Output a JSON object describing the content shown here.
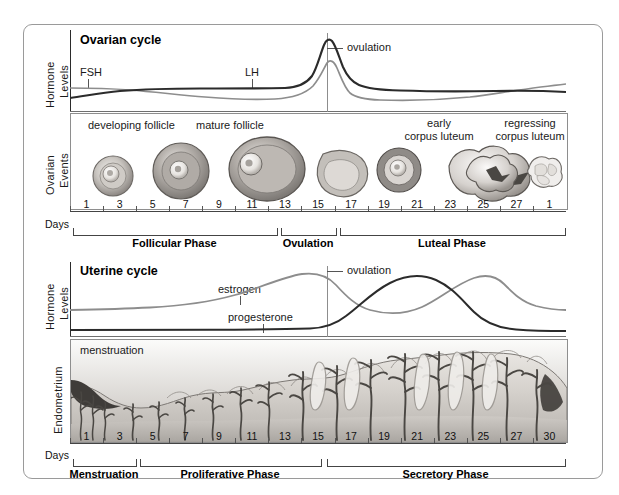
{
  "figure": {
    "colors": {
      "dark_curve": "#2b2b2b",
      "light_curve": "#8d8d8d",
      "frame": "#9a9a9a",
      "axis": "#2b2b2b",
      "tissue_light": "#e8e6e3",
      "tissue_mid": "#b9b5b0",
      "tissue_dark": "#6e6a66"
    }
  },
  "ovarian": {
    "panel_title": "Ovarian cycle",
    "y_axis_label_line1": "Hormone",
    "y_axis_label_line2": "Levels",
    "events_label_line1": "Ovarian",
    "events_label_line2": "Events",
    "curve_labels": [
      {
        "name": "FSH",
        "text": "FSH"
      },
      {
        "name": "LH",
        "text": "LH"
      }
    ],
    "ovulation_label": "ovulation",
    "event_captions": [
      {
        "id": "developing-follicle",
        "text": "developing follicle"
      },
      {
        "id": "mature-follicle",
        "text": "mature follicle"
      },
      {
        "id": "early-corpus-luteum",
        "line1": "early",
        "line2": "corpus luteum"
      },
      {
        "id": "regressing-corpus-luteum",
        "line1": "regressing",
        "line2": "corpus luteum"
      }
    ],
    "days_caption": "Days",
    "day_ticks": [
      "1",
      "3",
      "5",
      "7",
      "9",
      "11",
      "13",
      "15",
      "17",
      "19",
      "21",
      "23",
      "25",
      "27",
      "1"
    ],
    "phases": [
      {
        "id": "follicular",
        "label": "Follicular Phase"
      },
      {
        "id": "ovulation",
        "label": "Ovulation"
      },
      {
        "id": "luteal",
        "label": "Luteal Phase"
      }
    ]
  },
  "uterine": {
    "panel_title": "Uterine cycle",
    "y_axis_label_line1": "Hormone",
    "y_axis_label_line2": "Levels",
    "endometrium_label": "Endometrium",
    "curve_labels": [
      {
        "name": "estrogen",
        "text": "estrogen"
      },
      {
        "name": "progesterone",
        "text": "progesterone"
      }
    ],
    "ovulation_label": "ovulation",
    "menstruation_label": "menstruation",
    "days_caption": "Days",
    "day_ticks": [
      "1",
      "3",
      "5",
      "7",
      "9",
      "11",
      "13",
      "15",
      "17",
      "19",
      "21",
      "23",
      "25",
      "27",
      "30"
    ],
    "phases": [
      {
        "id": "menstruation",
        "label": "Menstruation"
      },
      {
        "id": "proliferative",
        "label": "Proliferative Phase"
      },
      {
        "id": "secretory",
        "label": "Secretory Phase"
      }
    ]
  },
  "chart_data": {
    "type": "line",
    "xlabel": "Days",
    "ylabel": "Hormone Levels",
    "x": [
      1,
      3,
      5,
      7,
      9,
      11,
      13,
      14,
      15,
      17,
      19,
      21,
      23,
      25,
      27,
      28
    ],
    "charts": [
      {
        "id": "ovarian-hormones",
        "title": "Ovarian cycle",
        "ylim": [
          0,
          100
        ],
        "grid": false,
        "legend": "inline-annotations",
        "series": [
          {
            "name": "LH",
            "color": "#2b2b2b",
            "values": [
              8,
              11,
              13,
              13,
              12,
              13,
              30,
              92,
              45,
              28,
              26,
              26,
              26,
              25,
              22,
              20
            ]
          },
          {
            "name": "FSH",
            "color": "#8d8d8d",
            "values": [
              22,
              22,
              20,
              17,
              14,
              13,
              22,
              55,
              18,
              12,
              13,
              14,
              18,
              25,
              30,
              32
            ]
          }
        ],
        "annotations": [
          {
            "text": "ovulation",
            "x": 14
          },
          {
            "text": "FSH",
            "x": 2
          },
          {
            "text": "LH",
            "x": 12
          }
        ]
      },
      {
        "id": "uterine-hormones",
        "title": "Uterine cycle",
        "ylim": [
          0,
          100
        ],
        "grid": false,
        "legend": "inline-annotations",
        "series": [
          {
            "name": "estrogen",
            "color": "#8d8d8d",
            "values": [
              22,
              22,
              24,
              26,
              30,
              42,
              72,
              80,
              70,
              44,
              38,
              42,
              58,
              76,
              62,
              40
            ]
          },
          {
            "name": "progesterone",
            "color": "#2b2b2b",
            "values": [
              6,
              6,
              6,
              6,
              6,
              6,
              7,
              10,
              20,
              52,
              76,
              84,
              80,
              58,
              26,
              12
            ]
          }
        ],
        "annotations": [
          {
            "text": "ovulation",
            "x": 14
          },
          {
            "text": "estrogen",
            "x": 10
          },
          {
            "text": "progesterone",
            "x": 11
          }
        ]
      }
    ]
  }
}
